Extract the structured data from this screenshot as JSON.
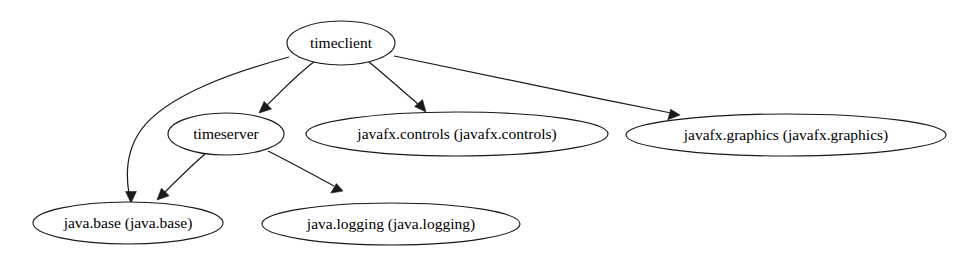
{
  "graph": {
    "title": "Java module dependency graph",
    "background_color": "#ffffff",
    "node_fill": "#ffffff",
    "node_stroke": "#1a1a1a",
    "edge_color": "#1a1a1a",
    "nodes": [
      {
        "id": "timeclient",
        "label": "timeclient",
        "cx": 341,
        "cy": 43,
        "rx": 54,
        "ry": 22
      },
      {
        "id": "timeserver",
        "label": "timeserver",
        "cx": 226,
        "cy": 134,
        "rx": 58,
        "ry": 21
      },
      {
        "id": "javafx.controls",
        "label": "javafx.controls (javafx.controls)",
        "cx": 457,
        "cy": 134,
        "rx": 151,
        "ry": 22
      },
      {
        "id": "javafx.graphics",
        "label": "javafx.graphics (javafx.graphics)",
        "cx": 786,
        "cy": 135,
        "rx": 160,
        "ry": 21
      },
      {
        "id": "java.base",
        "label": "java.base (java.base)",
        "cx": 128,
        "cy": 223,
        "rx": 95,
        "ry": 21
      },
      {
        "id": "java.logging",
        "label": "java.logging (java.logging)",
        "cx": 391,
        "cy": 224,
        "rx": 129,
        "ry": 21
      }
    ],
    "edges": [
      {
        "id": "edge-timeclient-java.base",
        "from": "timeclient",
        "to": "java.base",
        "path": "M289,57 C238,71 167,94 141,130 C126,151 126,176 129,194",
        "arrow": "131,203 125.6,191.6 136.4,191.4"
      },
      {
        "id": "edge-timeclient-timeserver",
        "from": "timeclient",
        "to": "timeserver",
        "path": "M315,61 C295,76 281,92 266,106",
        "arrow": "259,113 264.1,101.4 271.6,109.1"
      },
      {
        "id": "edge-timeclient-javafx.controls",
        "from": "timeclient",
        "to": "javafx.controls",
        "path": "M369,62 C386,76 403,91 419,105",
        "arrow": "426,112 414.6,106.6 422.5,99.6"
      },
      {
        "id": "edge-timeclient-javafx.graphics",
        "from": "timeclient",
        "to": "javafx.graphics",
        "path": "M394,56 C458,70 571,93 671,113",
        "arrow": "680,115 667.8,119.8 670.7,109.3"
      },
      {
        "id": "edge-timeserver-java.base",
        "from": "timeserver",
        "to": "java.base",
        "path": "M205,154 C191,166 177,180 164,193",
        "arrow": "157,200 161.4,188.3 169.2,195.7"
      },
      {
        "id": "edge-timeserver-java.logging",
        "from": "timeserver",
        "to": "java.logging",
        "path": "M268,151 C288,161 312,174 334,186",
        "arrow": "343,191 330.8,193.1 336.4,183.6"
      }
    ]
  }
}
